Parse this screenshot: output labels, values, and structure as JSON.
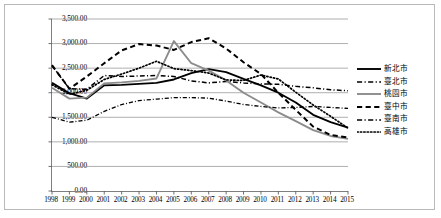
{
  "chart_data": {
    "type": "line",
    "title": "",
    "xlabel": "",
    "ylabel": "",
    "ylim": [
      0,
      3500
    ],
    "ytick_step": 500,
    "grid": true,
    "legend_position": "right",
    "ytick_labels": [
      "3,500.00",
      "3,000.00",
      "2,500.00",
      "2,000.00",
      "1,500.00",
      "1,000.00",
      "500.00",
      "0.00"
    ],
    "categories": [
      1998,
      1999,
      2000,
      2001,
      2002,
      2003,
      2004,
      2005,
      2006,
      2007,
      2008,
      2009,
      2010,
      2011,
      2012,
      2013,
      2014,
      2015
    ],
    "xtick_labels": [
      "1998",
      "1999",
      "2000",
      "2001",
      "2002",
      "2003",
      "2004",
      "2005",
      "2006",
      "2007",
      "2008",
      "2009",
      "2010",
      "2011",
      "2012",
      "2013",
      "2014",
      "2015"
    ],
    "series": [
      {
        "name": "新北市",
        "style": "solid",
        "color": "#000000",
        "width": 1.9,
        "values": [
          2200,
          1990,
          1880,
          2150,
          2160,
          2180,
          2200,
          2270,
          2400,
          2480,
          2420,
          2280,
          2150,
          2000,
          1800,
          1550,
          1400,
          1290
        ]
      },
      {
        "name": "臺北市",
        "style": "dashdot",
        "color": "#000000",
        "width": 1.5,
        "values": [
          2550,
          2080,
          2070,
          2350,
          2330,
          2340,
          2350,
          2330,
          2240,
          2200,
          2230,
          2200,
          2180,
          2170,
          2130,
          2100,
          2060,
          2040
        ]
      },
      {
        "name": "桃園市",
        "style": "solid",
        "color": "#8c8c8c",
        "width": 1.9,
        "values": [
          2100,
          1880,
          1900,
          2190,
          2210,
          2240,
          2290,
          3050,
          2600,
          2450,
          2250,
          2000,
          1800,
          1600,
          1420,
          1240,
          1120,
          1060
        ]
      },
      {
        "name": "臺中市",
        "style": "dashed",
        "color": "#000000",
        "width": 2.0,
        "values": [
          2560,
          2080,
          2330,
          2600,
          2860,
          2990,
          2960,
          2870,
          3030,
          3110,
          2900,
          2620,
          2380,
          2000,
          1650,
          1310,
          1140,
          1090
        ]
      },
      {
        "name": "臺南市",
        "style": "dashdot",
        "color": "#000000",
        "width": 1.3,
        "values": [
          1500,
          1400,
          1440,
          1620,
          1760,
          1840,
          1870,
          1900,
          1900,
          1890,
          1830,
          1760,
          1720,
          1690,
          1700,
          1720,
          1700,
          1680
        ]
      },
      {
        "name": "高雄市",
        "style": "dotted",
        "color": "#000000",
        "width": 1.7,
        "values": [
          2160,
          1970,
          2050,
          2270,
          2380,
          2500,
          2640,
          2490,
          2450,
          2400,
          2260,
          2250,
          2360,
          2280,
          2010,
          1750,
          1520,
          1280
        ]
      }
    ]
  }
}
